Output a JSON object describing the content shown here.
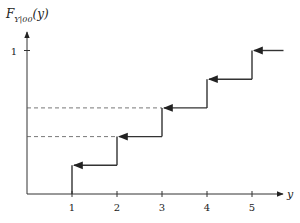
{
  "chart_data": {
    "type": "line",
    "subtype": "step-cdf",
    "title": "",
    "ylabel": "F",
    "ylabel_subscript": "Y|00",
    "ylabel_arg": "(y)",
    "xlabel": "y",
    "x_ticks": [
      "1",
      "2",
      "3",
      "4",
      "5"
    ],
    "y_ticks": [
      "1"
    ],
    "xlim": [
      0,
      5.7
    ],
    "ylim": [
      0,
      1.2
    ],
    "grid": false,
    "steps": [
      {
        "x_start": 1,
        "x_end": 2,
        "value": 0.2
      },
      {
        "x_start": 2,
        "x_end": 3,
        "value": 0.4
      },
      {
        "x_start": 3,
        "x_end": 4,
        "value": 0.6
      },
      {
        "x_start": 4,
        "x_end": 5,
        "value": 0.8
      },
      {
        "x_start": 5,
        "x_end": 5.7,
        "value": 1.0
      }
    ],
    "dashed_reference_lines": [
      {
        "value": 0.4,
        "x_end": 2
      },
      {
        "value": 0.6,
        "x_end": 3
      }
    ],
    "annotations": "Each horizontal step has a left-pointing arrowhead at its left (closed) end; vertical jumps at y = 1..5"
  },
  "colors": {
    "line": "#333333",
    "axis": "#333333",
    "dash": "#555555"
  }
}
